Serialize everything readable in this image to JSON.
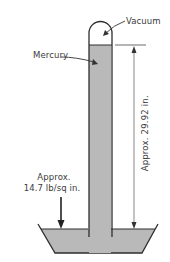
{
  "diagram": {
    "labels": {
      "vacuum": "Vacuum",
      "mercury": "Mercury",
      "height": "Approx. 29.92 in.",
      "pressure_line1": "Approx.",
      "pressure_line2": "14.7 lb/sq in."
    },
    "colors": {
      "mercury_fill": "#b9b9b9",
      "outline": "#2e2e2e",
      "background": "#ffffff",
      "dimension_line": "#444444"
    },
    "components": [
      "glass-tube",
      "vacuum-space",
      "mercury-column",
      "mercury-basin",
      "height-dimension",
      "pressure-arrow"
    ]
  }
}
